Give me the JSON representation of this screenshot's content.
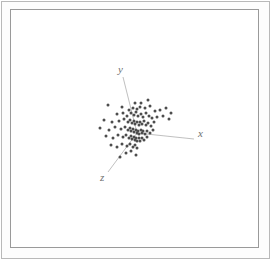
{
  "figure": {
    "title": "",
    "background_color": "#ffffff",
    "frame_color": "#9a9a9a",
    "outer_border_color": "#b9b9b9",
    "width": 273,
    "height": 262
  },
  "axes": {
    "origin": {
      "x": 137,
      "y": 133
    },
    "point_color": "#4d4d4d",
    "axis_color": "#b0b0b0",
    "items": [
      {
        "name": "x",
        "label": "x",
        "label_pos": {
          "x": 198,
          "y": 137
        },
        "line": {
          "x1": 137,
          "y1": 133,
          "x2": 194,
          "y2": 139
        }
      },
      {
        "name": "y",
        "label": "y",
        "label_pos": {
          "x": 118,
          "y": 73
        },
        "line": {
          "x1": 137,
          "y1": 133,
          "x2": 123,
          "y2": 77
        }
      },
      {
        "name": "z",
        "label": "z",
        "label_pos": {
          "x": 100,
          "y": 181
        },
        "line": {
          "x1": 137,
          "y1": 133,
          "x2": 108,
          "y2": 172
        }
      }
    ]
  },
  "chart_data": {
    "type": "scatter",
    "title": "",
    "xlabel": "x",
    "ylabel": "y",
    "zlabel": "z",
    "projection": "3d",
    "grid": false,
    "legend": "none",
    "marker_color": "#4d4d4d",
    "marker_size": 2,
    "point_count": 96,
    "xlim": [
      10,
      259
    ],
    "ylim": [
      9,
      248
    ],
    "note": "Pixel-space positions of plotted markers in the projected 3D scatter.",
    "points": [
      [
        122,
        107
      ],
      [
        135,
        103
      ],
      [
        141,
        103
      ],
      [
        148,
        100
      ],
      [
        108,
        105
      ],
      [
        129,
        110
      ],
      [
        133,
        108
      ],
      [
        137,
        109
      ],
      [
        140,
        107
      ],
      [
        145,
        108
      ],
      [
        150,
        106
      ],
      [
        155,
        111
      ],
      [
        160,
        110
      ],
      [
        166,
        108
      ],
      [
        171,
        113
      ],
      [
        117,
        114
      ],
      [
        123,
        113
      ],
      [
        127,
        116
      ],
      [
        131,
        113
      ],
      [
        134,
        115
      ],
      [
        136,
        112
      ],
      [
        138,
        116
      ],
      [
        141,
        114
      ],
      [
        143,
        117
      ],
      [
        146,
        113
      ],
      [
        149,
        116
      ],
      [
        152,
        118
      ],
      [
        157,
        117
      ],
      [
        163,
        116
      ],
      [
        169,
        119
      ],
      [
        104,
        120
      ],
      [
        112,
        122
      ],
      [
        119,
        121
      ],
      [
        124,
        119
      ],
      [
        128,
        122
      ],
      [
        130,
        120
      ],
      [
        132,
        123
      ],
      [
        134,
        121
      ],
      [
        135,
        124
      ],
      [
        137,
        122
      ],
      [
        139,
        125
      ],
      [
        140,
        122
      ],
      [
        142,
        124
      ],
      [
        144,
        121
      ],
      [
        146,
        125
      ],
      [
        148,
        123
      ],
      [
        151,
        126
      ],
      [
        154,
        122
      ],
      [
        100,
        128
      ],
      [
        109,
        130
      ],
      [
        115,
        127
      ],
      [
        121,
        129
      ],
      [
        125,
        127
      ],
      [
        128,
        130
      ],
      [
        130,
        128
      ],
      [
        131,
        131
      ],
      [
        133,
        129
      ],
      [
        134,
        132
      ],
      [
        136,
        130
      ],
      [
        137,
        133
      ],
      [
        138,
        131
      ],
      [
        139,
        134
      ],
      [
        141,
        130
      ],
      [
        142,
        133
      ],
      [
        143,
        131
      ],
      [
        145,
        134
      ],
      [
        147,
        131
      ],
      [
        150,
        133
      ],
      [
        153,
        130
      ],
      [
        106,
        136
      ],
      [
        113,
        138
      ],
      [
        118,
        135
      ],
      [
        123,
        137
      ],
      [
        126,
        135
      ],
      [
        129,
        138
      ],
      [
        131,
        136
      ],
      [
        132,
        139
      ],
      [
        134,
        137
      ],
      [
        135,
        140
      ],
      [
        136,
        138
      ],
      [
        137,
        141
      ],
      [
        139,
        138
      ],
      [
        140,
        141
      ],
      [
        142,
        138
      ],
      [
        144,
        140
      ],
      [
        147,
        137
      ],
      [
        111,
        145
      ],
      [
        117,
        147
      ],
      [
        122,
        144
      ],
      [
        127,
        146
      ],
      [
        130,
        144
      ],
      [
        133,
        147
      ],
      [
        135,
        145
      ],
      [
        137,
        148
      ],
      [
        126,
        153
      ],
      [
        131,
        151
      ],
      [
        136,
        155
      ],
      [
        120,
        157
      ]
    ]
  }
}
